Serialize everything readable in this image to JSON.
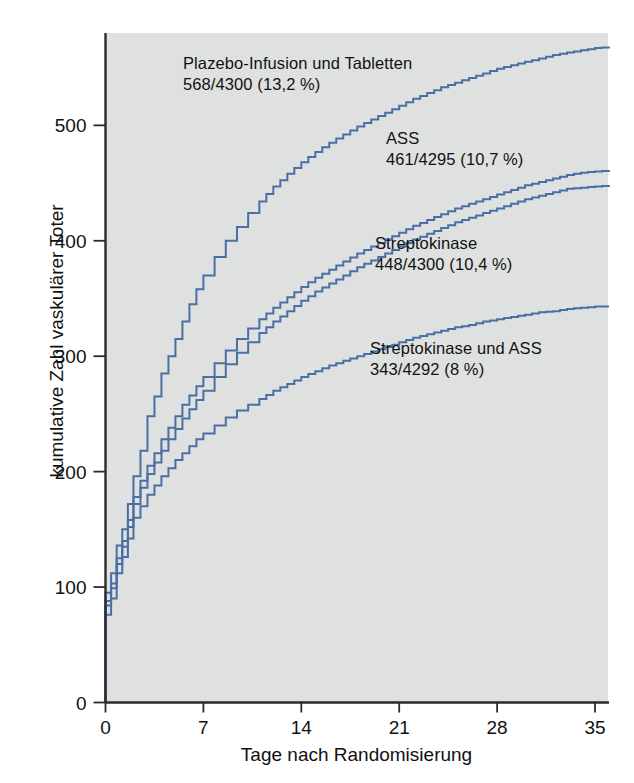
{
  "chart_data": {
    "type": "line",
    "subtype": "cumulative-step",
    "title": "",
    "xlabel": "Tage nach Randomisierung",
    "ylabel": "kumulative Zahl vaskulärer Toter",
    "xlim": [
      0,
      36
    ],
    "ylim": [
      0,
      580
    ],
    "xticks": [
      0,
      7,
      14,
      21,
      28,
      35
    ],
    "yticks": [
      0,
      100,
      200,
      300,
      400,
      500
    ],
    "grid": false,
    "legend_position": "inline-annotations",
    "line_color": "#4a6fa5",
    "plot_background": "#dfe1e0",
    "series": [
      {
        "name": "Plazebo-Infusion und Tabletten",
        "annotation_line1": "Plazebo-Infusion und Tabletten",
        "annotation_line2": "568/4300 (13,2 %)",
        "events": 568,
        "total": 4300,
        "percent": "13,2 %",
        "x": [
          0,
          0.4,
          0.8,
          1.2,
          1.6,
          2,
          2.5,
          3,
          3.5,
          4,
          4.5,
          5,
          5.5,
          6,
          6.5,
          7,
          7.8,
          8.6,
          9.4,
          10.2,
          11,
          12,
          13,
          14,
          15,
          16,
          17,
          18,
          19,
          20,
          21,
          22,
          23,
          24,
          25,
          26,
          27,
          28,
          29,
          30,
          31,
          32,
          33,
          34,
          35,
          36
        ],
        "y": [
          95,
          112,
          136,
          150,
          172,
          196,
          218,
          248,
          265,
          285,
          300,
          315,
          330,
          345,
          358,
          370,
          386,
          400,
          412,
          424,
          434,
          447,
          458,
          468,
          477,
          485,
          492,
          499,
          505,
          511,
          517,
          523,
          528,
          533,
          537,
          541,
          545,
          549,
          552,
          555,
          558,
          561,
          563,
          565,
          567,
          568
        ]
      },
      {
        "name": "ASS",
        "annotation_line1": "ASS",
        "annotation_line2": "461/4295 (10,7 %)",
        "events": 461,
        "total": 4295,
        "percent": "10,7 %",
        "x": [
          0,
          0.4,
          0.8,
          1.2,
          1.6,
          2,
          2.5,
          3,
          3.5,
          4,
          4.5,
          5,
          5.5,
          6,
          6.5,
          7,
          7.8,
          8.6,
          9.4,
          10.2,
          11,
          12,
          13,
          14,
          15,
          16,
          17,
          18,
          19,
          20,
          21,
          22,
          23,
          24,
          25,
          26,
          27,
          28,
          29,
          30,
          31,
          32,
          33,
          34,
          35,
          36
        ],
        "y": [
          88,
          103,
          125,
          140,
          158,
          178,
          192,
          205,
          216,
          228,
          238,
          248,
          258,
          266,
          274,
          282,
          294,
          305,
          315,
          324,
          332,
          342,
          351,
          360,
          368,
          375,
          382,
          389,
          395,
          401,
          407,
          413,
          418,
          423,
          428,
          432,
          436,
          440,
          444,
          448,
          451,
          454,
          457,
          459,
          460,
          461
        ]
      },
      {
        "name": "Streptokinase",
        "annotation_line1": "Streptokinase",
        "annotation_line2": "448/4300 (10,4 %)",
        "events": 448,
        "total": 4300,
        "percent": "10,4 %",
        "x": [
          0,
          0.4,
          0.8,
          1.2,
          1.6,
          2,
          2.5,
          3,
          3.5,
          4,
          4.5,
          5,
          5.5,
          6,
          6.5,
          7,
          7.8,
          8.6,
          9.4,
          10.2,
          11,
          12,
          13,
          14,
          15,
          16,
          17,
          18,
          19,
          20,
          21,
          22,
          23,
          24,
          25,
          26,
          27,
          28,
          29,
          30,
          31,
          32,
          33,
          34,
          35,
          36
        ],
        "y": [
          84,
          99,
          120,
          135,
          152,
          172,
          186,
          198,
          208,
          218,
          228,
          237,
          246,
          254,
          262,
          270,
          282,
          293,
          303,
          312,
          320,
          330,
          339,
          348,
          356,
          363,
          370,
          377,
          383,
          389,
          395,
          401,
          406,
          411,
          416,
          420,
          424,
          428,
          432,
          436,
          439,
          442,
          445,
          446,
          447,
          448
        ]
      },
      {
        "name": "Streptokinase und ASS",
        "annotation_line1": "Streptokinase und ASS",
        "annotation_line2": "343/4292 (8 %)",
        "events": 343,
        "total": 4292,
        "percent": "8 %",
        "x": [
          0,
          0.4,
          0.8,
          1.2,
          1.6,
          2,
          2.5,
          3,
          3.5,
          4,
          4.5,
          5,
          5.5,
          6,
          6.5,
          7,
          7.8,
          8.6,
          9.4,
          10.2,
          11,
          12,
          13,
          14,
          15,
          16,
          17,
          18,
          19,
          20,
          21,
          22,
          23,
          24,
          25,
          26,
          27,
          28,
          29,
          30,
          31,
          32,
          33,
          34,
          35,
          36
        ],
        "y": [
          76,
          90,
          112,
          126,
          142,
          160,
          170,
          180,
          188,
          196,
          203,
          210,
          216,
          222,
          228,
          233,
          240,
          247,
          253,
          258,
          263,
          270,
          276,
          282,
          287,
          292,
          296,
          300,
          304,
          308,
          312,
          316,
          319,
          322,
          325,
          327,
          330,
          332,
          334,
          336,
          338,
          339,
          341,
          342,
          343,
          343
        ]
      }
    ]
  },
  "axes": {
    "x_title": "Tage nach Randomisierung",
    "y_title": "kumulative Zahl vaskulärer Toter",
    "x_tick_labels": [
      "0",
      "7",
      "14",
      "21",
      "28",
      "35"
    ],
    "y_tick_labels": [
      "0",
      "100",
      "200",
      "300",
      "400",
      "500"
    ]
  },
  "annotations": {
    "placebo": {
      "line1": "Plazebo-Infusion und Tabletten",
      "line2": "568/4300 (13,2 %)"
    },
    "ass": {
      "line1": "ASS",
      "line2": "461/4295 (10,7 %)"
    },
    "streptokinase": {
      "line1": "Streptokinase",
      "line2": "448/4300 (10,4 %)"
    },
    "streptokinase_ass": {
      "line1": "Streptokinase und ASS",
      "line2": "343/4292 (8 %)"
    }
  },
  "colors": {
    "curve": "#4a6fa5",
    "plot_bg": "#dfe1e0",
    "axis": "#2b2b2b",
    "text": "#111111"
  }
}
